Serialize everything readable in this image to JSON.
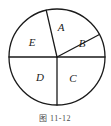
{
  "figure": {
    "type": "pie-sector-diagram",
    "caption": "图 11-12",
    "circle": {
      "center_x": 57,
      "center_y": 57,
      "radius": 48,
      "stroke_color": "#1a1a1a"
    },
    "sectors": [
      {
        "id": "A",
        "label": "A",
        "label_x": 61,
        "label_y": 28,
        "start_angle_deg": 28,
        "end_angle_deg": 103
      },
      {
        "id": "B",
        "label": "B",
        "label_x": 82,
        "label_y": 44,
        "start_angle_deg": 0,
        "end_angle_deg": 28
      },
      {
        "id": "C",
        "label": "C",
        "label_x": 73,
        "label_y": 79,
        "start_angle_deg": 270,
        "end_angle_deg": 360
      },
      {
        "id": "D",
        "label": "D",
        "label_x": 40,
        "label_y": 78,
        "start_angle_deg": 180,
        "end_angle_deg": 270
      },
      {
        "id": "E",
        "label": "E",
        "label_x": 32,
        "label_y": 43,
        "start_angle_deg": 103,
        "end_angle_deg": 180
      }
    ],
    "radii": [
      {
        "name": "radius-right",
        "angle_deg": 0
      },
      {
        "name": "radius-upper-right",
        "angle_deg": 28
      },
      {
        "name": "radius-upper-left",
        "angle_deg": 103
      },
      {
        "name": "radius-left",
        "angle_deg": 180
      },
      {
        "name": "radius-down",
        "angle_deg": 270
      }
    ],
    "caption_x": 55,
    "caption_y": 119
  }
}
